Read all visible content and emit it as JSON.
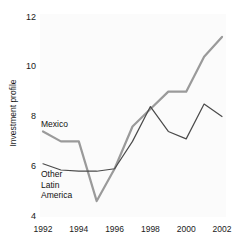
{
  "chart_data": {
    "type": "line",
    "title": "",
    "xlabel": "",
    "ylabel": "Investment profile",
    "x": [
      1992,
      1993,
      1994,
      1995,
      1996,
      1997,
      1998,
      1999,
      2000,
      2001,
      2002
    ],
    "xtick_labels": [
      "1992",
      "1994",
      "1996",
      "1998",
      "2000",
      "2002"
    ],
    "xticks": [
      1992,
      1994,
      1996,
      1998,
      2000,
      2002
    ],
    "ytick_labels": [
      "12",
      "10",
      "8",
      "6",
      "4"
    ],
    "yticks": [
      12,
      10,
      8,
      6,
      4
    ],
    "xlim": [
      1992,
      2002
    ],
    "ylim": [
      4,
      12
    ],
    "grid": false,
    "legend_position": "inline-annotation",
    "series": [
      {
        "name": "Mexico",
        "color": "#9a9a9a",
        "width": 2.2,
        "values": [
          7.4,
          7.0,
          7.0,
          4.6,
          5.9,
          7.6,
          8.3,
          9.0,
          9.0,
          10.4,
          11.2
        ]
      },
      {
        "name": "Other Latin America",
        "color": "#4a4a4a",
        "width": 1.2,
        "values": [
          6.1,
          5.85,
          5.8,
          5.8,
          5.9,
          7.0,
          8.4,
          7.4,
          7.1,
          8.5,
          8.0
        ]
      }
    ],
    "annotations": [
      {
        "id": "mexico",
        "text": "Mexico"
      },
      {
        "id": "other",
        "text": "Other\nLatin\nAmerica"
      }
    ]
  }
}
